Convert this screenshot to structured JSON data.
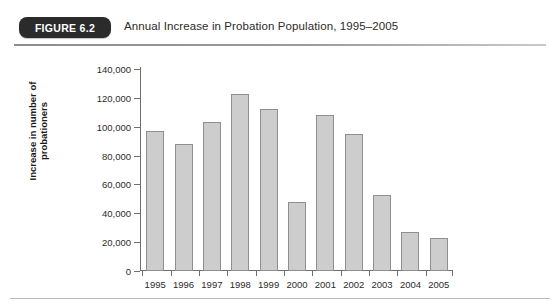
{
  "header": {
    "badge_label": "FIGURE 6.2",
    "caption": "Annual Increase in Probation Population, 1995–2005"
  },
  "chart_data": {
    "type": "bar",
    "title": "Annual Increase in Probation Population, 1995–2005",
    "xlabel": "",
    "ylabel": "Increase in number of probationers",
    "ylabel_lines": [
      "Increase in number of",
      "probationers"
    ],
    "categories": [
      "1995",
      "1996",
      "1997",
      "1998",
      "1999",
      "2000",
      "2001",
      "2002",
      "2003",
      "2004",
      "2005"
    ],
    "values": [
      97000,
      88000,
      103000,
      123000,
      112000,
      48000,
      108000,
      95000,
      53000,
      27000,
      23000
    ],
    "ylim": [
      0,
      140000
    ],
    "ytick_values": [
      0,
      20000,
      40000,
      60000,
      80000,
      100000,
      120000,
      140000
    ],
    "ytick_labels": [
      "0",
      "20,000",
      "40,000",
      "60,000",
      "80,000",
      "100,000",
      "120,000",
      "140,000"
    ],
    "grid": false,
    "legend": null,
    "bar_color": "#cdcdcd",
    "bar_border_color": "#8f8f8f",
    "axis_color": "#6f6f6f"
  }
}
